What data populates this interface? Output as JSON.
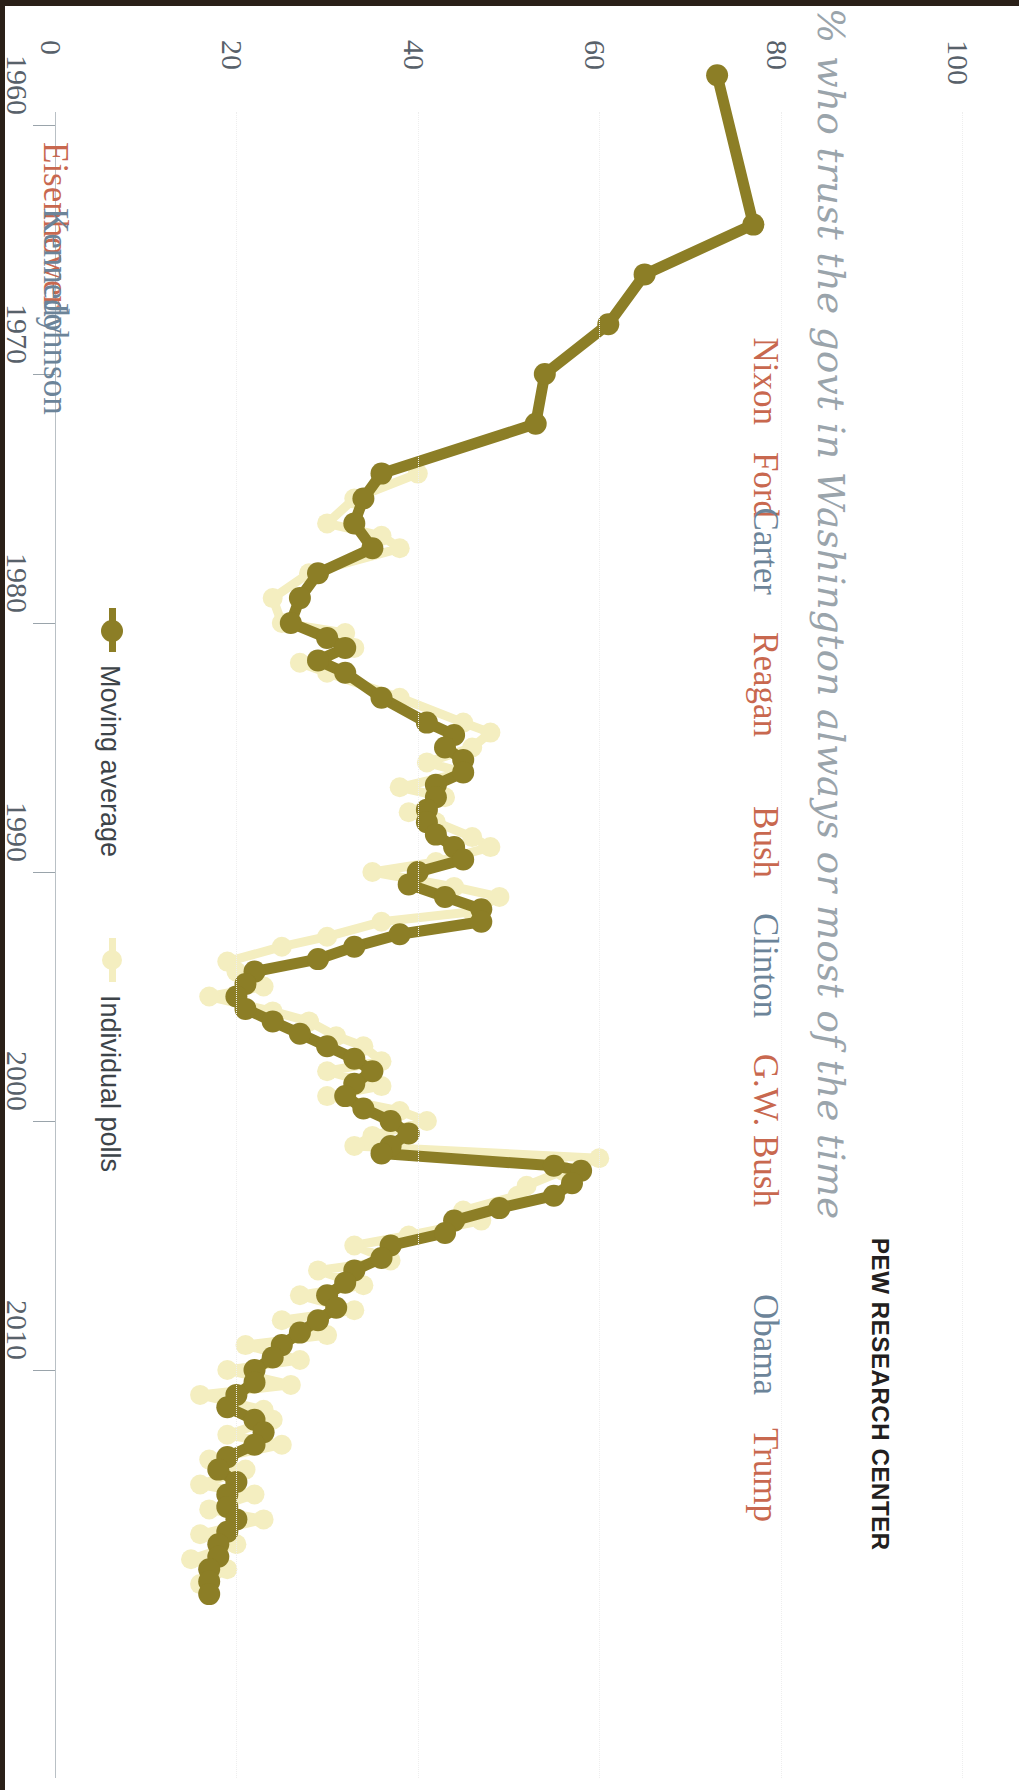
{
  "title": "% who trust the govt in Washington always or most of the time",
  "footer": "PEW RESEARCH CENTER",
  "legend": {
    "moving_average": "Moving average",
    "individual_polls": "Individual polls"
  },
  "colors": {
    "moving_average": "#8c7e26",
    "individual_polls": "#f4eec0",
    "republican": "#c8684f",
    "democrat": "#6c8499",
    "axis": "#9aa4ab",
    "title": "#9aa4ab"
  },
  "presidents": [
    {
      "name": "Eisenhower",
      "party": "rep",
      "y": 142
    },
    {
      "name": "Kennedy",
      "party": "dem",
      "y": 208
    },
    {
      "name": "Johnson",
      "party": "dem",
      "y": 300
    },
    {
      "name": "Nixon",
      "party": "rep",
      "y": 425
    },
    {
      "name": "Ford",
      "party": "rep",
      "y": 518
    },
    {
      "name": "Carter",
      "party": "dem",
      "y": 595
    },
    {
      "name": "Reagan",
      "party": "rep",
      "y": 737
    },
    {
      "name": "Bush",
      "party": "rep",
      "y": 878
    },
    {
      "name": "Clinton",
      "party": "dem",
      "y": 1018
    },
    {
      "name": "G.W. Bush",
      "party": "rep",
      "y": 1207
    },
    {
      "name": "Obama",
      "party": "dem",
      "y": 1395
    },
    {
      "name": "Trump",
      "party": "rep",
      "y": 1522
    }
  ],
  "chart_data": {
    "type": "line",
    "orientation": "vertical-time",
    "title": "% who trust the govt in Washington always or most of the time",
    "xlabel": "% who trust the government",
    "ylabel": "Year",
    "xlim": [
      0,
      100
    ],
    "ylim": [
      1958,
      2019
    ],
    "xticks": [
      0,
      20,
      40,
      60,
      80,
      100
    ],
    "yticks": [
      1960,
      1970,
      1980,
      1990,
      2000,
      2010
    ],
    "grid": false,
    "legend_position": "left-middle",
    "series": [
      {
        "name": "Moving average",
        "color": "#8c7e26",
        "points": [
          [
            1958,
            73
          ],
          [
            1964,
            77
          ],
          [
            1966,
            65
          ],
          [
            1968,
            61
          ],
          [
            1970,
            54
          ],
          [
            1972,
            53
          ],
          [
            1974,
            36
          ],
          [
            1975,
            34
          ],
          [
            1976,
            33
          ],
          [
            1977,
            35
          ],
          [
            1978,
            29
          ],
          [
            1979,
            27
          ],
          [
            1980,
            26
          ],
          [
            1980.6,
            30
          ],
          [
            1981,
            32
          ],
          [
            1981.5,
            29
          ],
          [
            1982,
            32
          ],
          [
            1983,
            36
          ],
          [
            1984,
            41
          ],
          [
            1984.5,
            44
          ],
          [
            1985,
            43
          ],
          [
            1985.5,
            45
          ],
          [
            1986,
            45
          ],
          [
            1986.5,
            42
          ],
          [
            1987,
            42
          ],
          [
            1987.5,
            41
          ],
          [
            1988,
            41
          ],
          [
            1988.5,
            42
          ],
          [
            1989,
            44
          ],
          [
            1989.5,
            45
          ],
          [
            1990,
            40
          ],
          [
            1990.5,
            39
          ],
          [
            1991,
            43
          ],
          [
            1991.5,
            47
          ],
          [
            1992,
            47
          ],
          [
            1992.5,
            38
          ],
          [
            1993,
            33
          ],
          [
            1993.5,
            29
          ],
          [
            1994,
            22
          ],
          [
            1994.5,
            21
          ],
          [
            1995,
            20
          ],
          [
            1995.5,
            21
          ],
          [
            1996,
            24
          ],
          [
            1996.5,
            27
          ],
          [
            1997,
            30
          ],
          [
            1997.5,
            33
          ],
          [
            1998,
            35
          ],
          [
            1998.5,
            33
          ],
          [
            1999,
            32
          ],
          [
            1999.5,
            34
          ],
          [
            2000,
            37
          ],
          [
            2000.5,
            39
          ],
          [
            2001,
            37
          ],
          [
            2001.3,
            36
          ],
          [
            2001.8,
            55
          ],
          [
            2002,
            58
          ],
          [
            2002.5,
            57
          ],
          [
            2003,
            55
          ],
          [
            2003.5,
            49
          ],
          [
            2004,
            44
          ],
          [
            2004.5,
            43
          ],
          [
            2005,
            37
          ],
          [
            2005.5,
            36
          ],
          [
            2006,
            33
          ],
          [
            2006.5,
            32
          ],
          [
            2007,
            30
          ],
          [
            2007.5,
            31
          ],
          [
            2008,
            29
          ],
          [
            2008.5,
            27
          ],
          [
            2009,
            25
          ],
          [
            2009.5,
            24
          ],
          [
            2010,
            22
          ],
          [
            2010.5,
            22
          ],
          [
            2011,
            20
          ],
          [
            2011.5,
            19
          ],
          [
            2012,
            22
          ],
          [
            2012.5,
            23
          ],
          [
            2013,
            22
          ],
          [
            2013.5,
            19
          ],
          [
            2014,
            18
          ],
          [
            2014.5,
            20
          ],
          [
            2015,
            19
          ],
          [
            2015.5,
            19
          ],
          [
            2016,
            20
          ],
          [
            2016.5,
            19
          ],
          [
            2017,
            18
          ],
          [
            2017.5,
            18
          ],
          [
            2018,
            17
          ],
          [
            2018.5,
            17
          ],
          [
            2019,
            17
          ]
        ]
      },
      {
        "name": "Individual polls",
        "color": "#f4eec0",
        "points": [
          [
            1974,
            40
          ],
          [
            1975,
            33
          ],
          [
            1976,
            30
          ],
          [
            1976.5,
            36
          ],
          [
            1977,
            38
          ],
          [
            1978,
            28
          ],
          [
            1979,
            24
          ],
          [
            1980,
            25
          ],
          [
            1980.4,
            32
          ],
          [
            1981,
            33
          ],
          [
            1981.6,
            27
          ],
          [
            1982,
            30
          ],
          [
            1983,
            38
          ],
          [
            1984,
            45
          ],
          [
            1984.4,
            48
          ],
          [
            1985,
            46
          ],
          [
            1985.6,
            41
          ],
          [
            1986,
            45
          ],
          [
            1986.6,
            38
          ],
          [
            1987,
            43
          ],
          [
            1987.6,
            39
          ],
          [
            1988,
            42
          ],
          [
            1988.6,
            46
          ],
          [
            1989,
            48
          ],
          [
            1989.6,
            42
          ],
          [
            1990,
            35
          ],
          [
            1990.6,
            44
          ],
          [
            1991,
            49
          ],
          [
            1991.6,
            46
          ],
          [
            1992,
            36
          ],
          [
            1992.6,
            30
          ],
          [
            1993,
            25
          ],
          [
            1993.6,
            19
          ],
          [
            1994,
            20
          ],
          [
            1994.6,
            23
          ],
          [
            1995,
            17
          ],
          [
            1995.6,
            24
          ],
          [
            1996,
            28
          ],
          [
            1996.6,
            31
          ],
          [
            1997,
            34
          ],
          [
            1997.6,
            36
          ],
          [
            1998,
            30
          ],
          [
            1998.6,
            36
          ],
          [
            1999,
            30
          ],
          [
            1999.6,
            38
          ],
          [
            2000,
            41
          ],
          [
            2000.6,
            35
          ],
          [
            2001,
            33
          ],
          [
            2001.5,
            60
          ],
          [
            2002,
            56
          ],
          [
            2002.6,
            52
          ],
          [
            2003,
            51
          ],
          [
            2003.6,
            45
          ],
          [
            2004,
            47
          ],
          [
            2004.6,
            39
          ],
          [
            2005,
            33
          ],
          [
            2005.6,
            37
          ],
          [
            2006,
            29
          ],
          [
            2006.6,
            34
          ],
          [
            2007,
            27
          ],
          [
            2007.6,
            33
          ],
          [
            2008,
            25
          ],
          [
            2008.6,
            30
          ],
          [
            2009,
            21
          ],
          [
            2009.6,
            27
          ],
          [
            2010,
            19
          ],
          [
            2010.6,
            26
          ],
          [
            2011,
            16
          ],
          [
            2011.6,
            23
          ],
          [
            2012,
            24
          ],
          [
            2012.6,
            19
          ],
          [
            2013,
            25
          ],
          [
            2013.6,
            17
          ],
          [
            2014,
            21
          ],
          [
            2014.6,
            16
          ],
          [
            2015,
            22
          ],
          [
            2015.6,
            17
          ],
          [
            2016,
            23
          ],
          [
            2016.6,
            16
          ],
          [
            2017,
            20
          ],
          [
            2017.6,
            15
          ],
          [
            2018,
            19
          ],
          [
            2018.6,
            16
          ]
        ]
      }
    ]
  }
}
